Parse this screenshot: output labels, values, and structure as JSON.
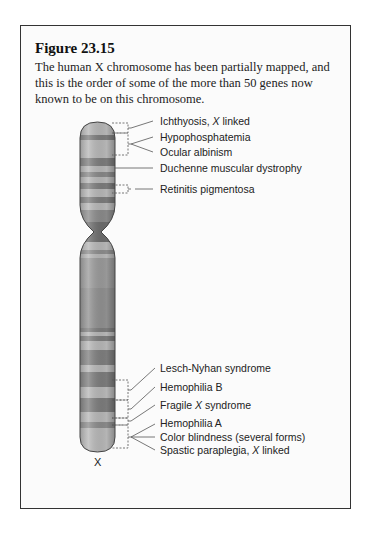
{
  "figure": {
    "title": "Figure 23.15",
    "caption": "The human X chromosome has been partially mapped, and this is the order of some of the more than 50 genes now known to be on this chromosome.",
    "chromosome_label": "X"
  },
  "genes": [
    {
      "pre": "Ichthyosis, ",
      "it": "X",
      "post": " linked"
    },
    {
      "pre": "Hypophosphatemia",
      "it": "",
      "post": ""
    },
    {
      "pre": "Ocular albinism",
      "it": "",
      "post": ""
    },
    {
      "pre": "Duchenne muscular dystrophy",
      "it": "",
      "post": ""
    },
    {
      "pre": "Retinitis pigmentosa",
      "it": "",
      "post": ""
    },
    {
      "pre": "Lesch-Nyhan syndrome",
      "it": "",
      "post": ""
    },
    {
      "pre": "Hemophilia B",
      "it": "",
      "post": ""
    },
    {
      "pre": "Fragile ",
      "it": "X",
      "post": " syndrome"
    },
    {
      "pre": "Hemophilia A",
      "it": "",
      "post": ""
    },
    {
      "pre": "Color blindness (several forms)",
      "it": "",
      "post": ""
    },
    {
      "pre": "Spastic paraplegia, ",
      "it": "X",
      "post": " linked"
    }
  ],
  "colors": {
    "frame": "#333333",
    "band_dark": "#7a7a7a",
    "band_light": "#b8b8b8",
    "outline": "#444444"
  }
}
